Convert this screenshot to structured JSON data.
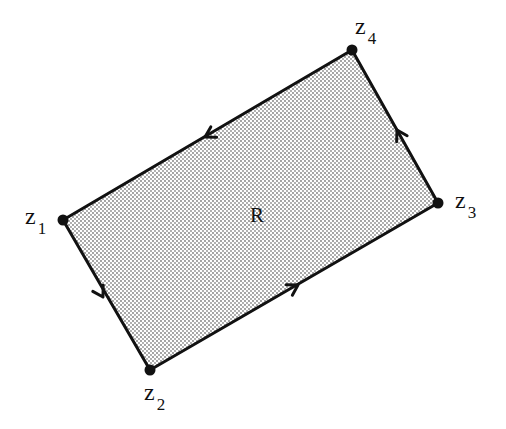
{
  "diagram": {
    "type": "contour-rectangle",
    "region_label": "R",
    "fill": "stippled gray",
    "colors": {
      "stroke": "#111111",
      "fill_dot": "#7a7a7a",
      "background": "#ffffff"
    },
    "vertices": [
      {
        "id": "z1",
        "base": "z",
        "sub": "1",
        "x": 63,
        "y": 220
      },
      {
        "id": "z2",
        "base": "z",
        "sub": "2",
        "x": 150,
        "y": 370
      },
      {
        "id": "z3",
        "base": "z",
        "sub": "3",
        "x": 438,
        "y": 203
      },
      {
        "id": "z4",
        "base": "z",
        "sub": "4",
        "x": 352,
        "y": 50
      }
    ],
    "edges": [
      {
        "from": "z1",
        "to": "z2",
        "arrow": "forward"
      },
      {
        "from": "z2",
        "to": "z3",
        "arrow": "forward"
      },
      {
        "from": "z3",
        "to": "z4",
        "arrow": "forward"
      },
      {
        "from": "z4",
        "to": "z1",
        "arrow": "forward"
      }
    ],
    "orientation": "counterclockwise"
  }
}
